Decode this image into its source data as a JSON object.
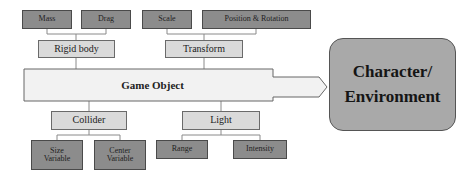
{
  "diagram": {
    "top": {
      "rigid_body": {
        "label": "Rigid body",
        "children": [
          "Mass",
          "Drag"
        ]
      },
      "transform": {
        "label": "Transform",
        "children": [
          "Scale",
          "Position & Rotation"
        ]
      }
    },
    "center": {
      "label": "Game Object"
    },
    "bottom": {
      "collider": {
        "label": "Collider",
        "children": [
          "Size Variable",
          "Center Variable"
        ]
      },
      "light": {
        "label": "Light",
        "children": [
          "Range",
          "Intensity"
        ]
      }
    },
    "target": {
      "line1": "Character/",
      "line2": "Environment"
    },
    "colors": {
      "leaf_fill": "#8c8c8c",
      "component_fill": "#dadada",
      "game_object_fill": "#f2f2f2",
      "target_fill": "#a9a9a9"
    }
  }
}
